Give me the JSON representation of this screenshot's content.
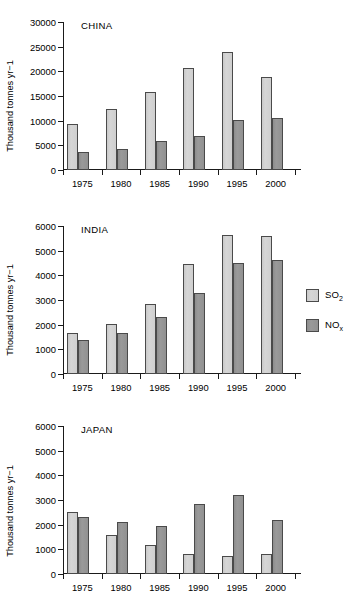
{
  "figure": {
    "axis_title": "Thousand tonnes yr−1"
  },
  "legend": {
    "position": "right-middle",
    "entries": [
      {
        "name": "SO2",
        "label_main": "SO",
        "label_sub": "2",
        "color": "#d2d2d2"
      },
      {
        "name": "NOx",
        "label_main": "NO",
        "label_sub": "x",
        "color": "#949494"
      }
    ]
  },
  "chart_data": [
    {
      "type": "bar",
      "title": "CHINA",
      "xlabel": "",
      "ylabel": "Thousand tonnes yr−1",
      "categories": [
        "1975",
        "1980",
        "1985",
        "1990",
        "1995",
        "2000"
      ],
      "ylim": [
        0,
        30000
      ],
      "yticks": [
        0,
        5000,
        10000,
        15000,
        20000,
        25000,
        30000
      ],
      "ytick_labels": [
        "0",
        "5000",
        "10000",
        "15000",
        "20000",
        "25000",
        "30000"
      ],
      "grid": false,
      "series": [
        {
          "name": "SO2",
          "values": [
            9400,
            12300,
            15900,
            20600,
            23900,
            18800
          ]
        },
        {
          "name": "NOx",
          "values": [
            3600,
            4350,
            5800,
            6850,
            10150,
            10500
          ]
        }
      ]
    },
    {
      "type": "bar",
      "title": "INDIA",
      "xlabel": "",
      "ylabel": "Thousand tonnes yr−1",
      "categories": [
        "1975",
        "1980",
        "1985",
        "1990",
        "1995",
        "2000"
      ],
      "ylim": [
        0,
        6000
      ],
      "yticks": [
        0,
        1000,
        2000,
        3000,
        4000,
        5000,
        6000
      ],
      "ytick_labels": [
        "0",
        "1000",
        "2000",
        "3000",
        "4000",
        "5000",
        "6000"
      ],
      "grid": false,
      "series": [
        {
          "name": "SO2",
          "values": [
            1650,
            2020,
            2820,
            4480,
            5650,
            5580
          ]
        },
        {
          "name": "NOx",
          "values": [
            1370,
            1660,
            2320,
            3270,
            4490,
            4620
          ]
        }
      ]
    },
    {
      "type": "bar",
      "title": "JAPAN",
      "xlabel": "",
      "ylabel": "Thousand tonnes yr−1",
      "categories": [
        "1975",
        "1980",
        "1985",
        "1990",
        "1995",
        "2000"
      ],
      "ylim": [
        0,
        6000
      ],
      "yticks": [
        0,
        1000,
        2000,
        3000,
        4000,
        5000,
        6000
      ],
      "ytick_labels": [
        "0",
        "1000",
        "2000",
        "3000",
        "4000",
        "5000",
        "6000"
      ],
      "grid": false,
      "series": [
        {
          "name": "SO2",
          "values": [
            2530,
            1590,
            1170,
            810,
            730,
            810
          ]
        },
        {
          "name": "NOx",
          "values": [
            2300,
            2090,
            1960,
            2820,
            3190,
            2180
          ]
        }
      ]
    }
  ]
}
